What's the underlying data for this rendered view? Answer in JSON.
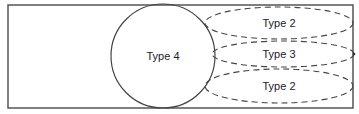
{
  "diagram": {
    "frame": {
      "x": 8,
      "y": 5,
      "width": 345,
      "height": 103,
      "stroke": "#555555"
    },
    "circle": {
      "label": "Type 4",
      "cx": 163,
      "cy": 56,
      "r": 52,
      "stroke": "#444444"
    },
    "ellipses": [
      {
        "label": "Type 2",
        "cx": 279,
        "cy": 23,
        "rx": 74,
        "ry": 16
      },
      {
        "label": "Type 3",
        "cx": 283,
        "cy": 54,
        "rx": 71,
        "ry": 13
      },
      {
        "label": "Type 2",
        "cx": 279,
        "cy": 86,
        "rx": 74,
        "ry": 17
      }
    ],
    "dash_color": "#444444"
  }
}
